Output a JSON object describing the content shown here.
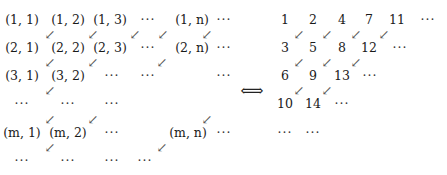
{
  "left_grid": {
    "cells": [
      {
        "t": "(1, 1)",
        "x": 22,
        "y": 20
      },
      {
        "t": "(1, 2)",
        "x": 68,
        "y": 20
      },
      {
        "t": "(1, 3)",
        "x": 110,
        "y": 20
      },
      {
        "t": "···",
        "x": 148,
        "y": 20,
        "dots": true
      },
      {
        "t": "(1, n)",
        "x": 192,
        "y": 20
      },
      {
        "t": "···",
        "x": 224,
        "y": 20,
        "dots": true
      },
      {
        "t": "(2, 1)",
        "x": 22,
        "y": 48
      },
      {
        "t": "(2, 2)",
        "x": 68,
        "y": 48
      },
      {
        "t": "(2, 3)",
        "x": 110,
        "y": 48
      },
      {
        "t": "···",
        "x": 148,
        "y": 48,
        "dots": true
      },
      {
        "t": "(2, n)",
        "x": 192,
        "y": 48
      },
      {
        "t": "···",
        "x": 224,
        "y": 48,
        "dots": true
      },
      {
        "t": "(3, 1)",
        "x": 22,
        "y": 76
      },
      {
        "t": "(3, 2)",
        "x": 68,
        "y": 76
      },
      {
        "t": "···",
        "x": 112,
        "y": 76,
        "dots": true
      },
      {
        "t": "···",
        "x": 148,
        "y": 76,
        "dots": true
      },
      {
        "t": "···",
        "x": 224,
        "y": 76,
        "dots": true
      },
      {
        "t": "···",
        "x": 22,
        "y": 104,
        "dots": true
      },
      {
        "t": "···",
        "x": 68,
        "y": 104,
        "dots": true
      },
      {
        "t": "···",
        "x": 112,
        "y": 104,
        "dots": true
      },
      {
        "t": "(m, 1)",
        "x": 22,
        "y": 133
      },
      {
        "t": "(m, 2)",
        "x": 68,
        "y": 133
      },
      {
        "t": "···",
        "x": 112,
        "y": 133,
        "dots": true
      },
      {
        "t": "(m, n)",
        "x": 188,
        "y": 133
      },
      {
        "t": "···",
        "x": 224,
        "y": 133,
        "dots": true
      },
      {
        "t": "···",
        "x": 22,
        "y": 161,
        "dots": true
      },
      {
        "t": "···",
        "x": 68,
        "y": 161,
        "dots": true
      },
      {
        "t": "···",
        "x": 112,
        "y": 161,
        "dots": true
      },
      {
        "t": "···",
        "x": 145,
        "y": 161,
        "dots": true
      }
    ],
    "arrows": [
      {
        "x": 50,
        "y": 34
      },
      {
        "x": 93,
        "y": 34
      },
      {
        "x": 135,
        "y": 34
      },
      {
        "x": 163,
        "y": 34
      },
      {
        "x": 207,
        "y": 34
      },
      {
        "x": 50,
        "y": 62
      },
      {
        "x": 93,
        "y": 62
      },
      {
        "x": 162,
        "y": 62
      },
      {
        "x": 50,
        "y": 90
      },
      {
        "x": 50,
        "y": 119
      },
      {
        "x": 93,
        "y": 119
      },
      {
        "x": 207,
        "y": 119
      },
      {
        "x": 50,
        "y": 147
      },
      {
        "x": 162,
        "y": 147
      }
    ]
  },
  "equivalence_symbol": "⟺",
  "right_grid": {
    "cells": [
      {
        "t": "1",
        "x": 285,
        "y": 20
      },
      {
        "t": "2",
        "x": 313,
        "y": 20
      },
      {
        "t": "4",
        "x": 342,
        "y": 20
      },
      {
        "t": "7",
        "x": 369,
        "y": 20
      },
      {
        "t": "11",
        "x": 397,
        "y": 20
      },
      {
        "t": "···",
        "x": 428,
        "y": 20,
        "dots": true
      },
      {
        "t": "3",
        "x": 285,
        "y": 48
      },
      {
        "t": "5",
        "x": 313,
        "y": 48
      },
      {
        "t": "8",
        "x": 342,
        "y": 48
      },
      {
        "t": "12",
        "x": 369,
        "y": 48
      },
      {
        "t": "···",
        "x": 400,
        "y": 48,
        "dots": true
      },
      {
        "t": "6",
        "x": 285,
        "y": 76
      },
      {
        "t": "9",
        "x": 313,
        "y": 76
      },
      {
        "t": "13",
        "x": 342,
        "y": 76
      },
      {
        "t": "···",
        "x": 370,
        "y": 76,
        "dots": true
      },
      {
        "t": "10",
        "x": 285,
        "y": 104
      },
      {
        "t": "14",
        "x": 313,
        "y": 104
      },
      {
        "t": "···",
        "x": 342,
        "y": 104,
        "dots": true
      },
      {
        "t": "···",
        "x": 285,
        "y": 133,
        "dots": true
      },
      {
        "t": "···",
        "x": 313,
        "y": 133,
        "dots": true
      }
    ],
    "arrows": [
      {
        "x": 299,
        "y": 34
      },
      {
        "x": 327,
        "y": 34
      },
      {
        "x": 356,
        "y": 34
      },
      {
        "x": 384,
        "y": 34
      },
      {
        "x": 299,
        "y": 62
      },
      {
        "x": 327,
        "y": 62
      },
      {
        "x": 356,
        "y": 62
      },
      {
        "x": 299,
        "y": 90
      },
      {
        "x": 327,
        "y": 90
      }
    ]
  },
  "arrow_glyph": "↙"
}
